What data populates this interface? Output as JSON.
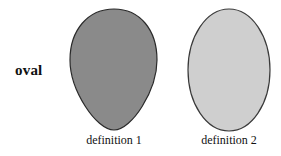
{
  "figure": {
    "row_label": "oval",
    "shapes": [
      {
        "kind": "egg",
        "caption": "definition 1",
        "fill": "#8a8a8a",
        "stroke": "#2a2a2a"
      },
      {
        "kind": "ellipse",
        "caption": "definition 2",
        "fill": "#cfcfcf",
        "stroke": "#3a3a3a"
      }
    ]
  }
}
